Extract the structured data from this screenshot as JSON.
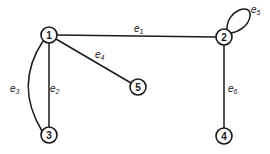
{
  "diagram": {
    "type": "undirected-graph",
    "nodes": [
      {
        "id": "1",
        "label": "1",
        "x": 49,
        "y": 35
      },
      {
        "id": "2",
        "label": "2",
        "x": 224,
        "y": 37
      },
      {
        "id": "3",
        "label": "3",
        "x": 49,
        "y": 135
      },
      {
        "id": "4",
        "label": "4",
        "x": 224,
        "y": 136
      },
      {
        "id": "5",
        "label": "5",
        "x": 138,
        "y": 87
      }
    ],
    "edges": [
      {
        "id": "e1",
        "base": "e",
        "sub": "1",
        "from": "1",
        "to": "2"
      },
      {
        "id": "e2",
        "base": "e",
        "sub": "2",
        "from": "1",
        "to": "3"
      },
      {
        "id": "e3",
        "base": "e",
        "sub": "3",
        "from": "1",
        "to": "3",
        "curved": true
      },
      {
        "id": "e4",
        "base": "e",
        "sub": "4",
        "from": "1",
        "to": "5"
      },
      {
        "id": "e5",
        "base": "e",
        "sub": "5",
        "from": "2",
        "to": "2",
        "self_loop": true
      },
      {
        "id": "e6",
        "base": "e",
        "sub": "6",
        "from": "2",
        "to": "4"
      }
    ]
  }
}
